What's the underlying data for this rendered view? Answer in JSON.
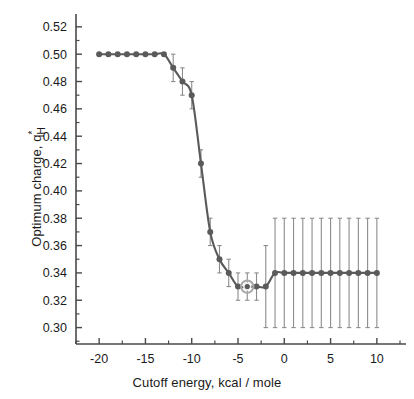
{
  "chart_data": {
    "type": "line",
    "title": "",
    "subtitle": "",
    "xlabel": "Cutoff energy, kcal / mole",
    "ylabel": "Optimum charge, q*H",
    "ylabel_parts": {
      "text": "Optimum charge, q",
      "superscript": "*",
      "subscript": "H"
    },
    "xlim": [
      -22.5,
      12.5
    ],
    "ylim": [
      0.288,
      0.525
    ],
    "xticks": [
      -20,
      -15,
      -10,
      -5,
      0,
      5,
      10
    ],
    "xtick_labels": [
      "-20",
      "-15",
      "-10",
      "-5",
      "0",
      "5",
      "10"
    ],
    "xminor_step": 2.5,
    "yticks": [
      0.3,
      0.32,
      0.34,
      0.36,
      0.38,
      0.4,
      0.42,
      0.44,
      0.46,
      0.48,
      0.5,
      0.52
    ],
    "ytick_labels": [
      "0.30",
      "0.32",
      "0.34",
      "0.36",
      "0.38",
      "0.40",
      "0.42",
      "0.44",
      "0.46",
      "0.48",
      "0.50",
      "0.52"
    ],
    "yminor_step": 0.01,
    "grid": false,
    "legend": null,
    "series": [
      {
        "name": "Optimum charge",
        "color": "#5a5a5a",
        "marker": "circle",
        "x": [
          -20,
          -19,
          -18,
          -17,
          -16,
          -15,
          -14,
          -13,
          -12,
          -11,
          -10,
          -9,
          -8,
          -7,
          -6,
          -5,
          -4,
          -3,
          -2,
          -1,
          0,
          1,
          2,
          3,
          4,
          5,
          6,
          7,
          8,
          9,
          10
        ],
        "y": [
          0.5,
          0.5,
          0.5,
          0.5,
          0.5,
          0.5,
          0.5,
          0.5,
          0.49,
          0.48,
          0.47,
          0.42,
          0.37,
          0.35,
          0.34,
          0.33,
          0.33,
          0.33,
          0.33,
          0.34,
          0.34,
          0.34,
          0.34,
          0.34,
          0.34,
          0.34,
          0.34,
          0.34,
          0.34,
          0.34,
          0.34
        ],
        "yerr_low": [
          0,
          0,
          0,
          0,
          0,
          0,
          0,
          0,
          0.01,
          0.01,
          0.01,
          0.01,
          0.01,
          0.01,
          0.01,
          0.01,
          0.01,
          0.01,
          0.03,
          0.04,
          0.04,
          0.04,
          0.04,
          0.04,
          0.04,
          0.04,
          0.04,
          0.04,
          0.04,
          0.04,
          0.04
        ],
        "yerr_high": [
          0,
          0,
          0,
          0,
          0,
          0,
          0,
          0,
          0.01,
          0.01,
          0.01,
          0.01,
          0.01,
          0.01,
          0.01,
          0.01,
          0.01,
          0.01,
          0.03,
          0.04,
          0.04,
          0.04,
          0.04,
          0.04,
          0.04,
          0.04,
          0.04,
          0.04,
          0.04,
          0.04,
          0.04
        ]
      }
    ],
    "annotations": [
      {
        "name": "highlighted-point",
        "x": -4,
        "y": 0.33,
        "style": "open-ring-halo"
      }
    ]
  },
  "axis": {
    "line_color": "#4a4a4a",
    "text_color": "#1a1a1a"
  }
}
